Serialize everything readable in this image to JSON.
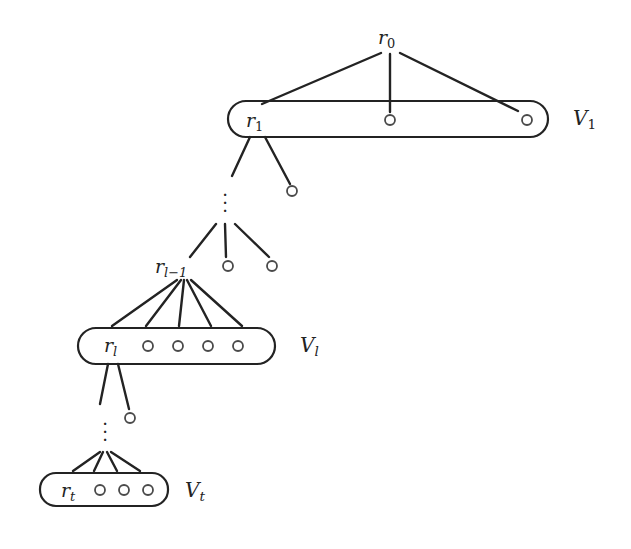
{
  "figure": {
    "type": "tree-diagram",
    "background_color": "#ffffff",
    "ink_color": "#232323"
  },
  "nodes": {
    "r0": {
      "label_base": "r",
      "label_sub": "0",
      "x": 390,
      "y": 38
    },
    "r1": {
      "label_base": "r",
      "label_sub": "1",
      "x": 258,
      "y": 121
    },
    "rl1": {
      "label_base": "r",
      "label_sub": "l−1",
      "x": 184,
      "y": 267
    },
    "rl": {
      "label_base": "r",
      "label_sub": "l",
      "x": 114,
      "y": 346
    },
    "rt": {
      "label_base": "r",
      "label_sub": "t",
      "x": 72,
      "y": 491
    }
  },
  "node_labels": {
    "r0": "r0",
    "r1": "r1",
    "rl1": "rl-1",
    "rl": "rl",
    "rt": "rt"
  },
  "set_labels": [
    {
      "name": "V1",
      "base": "V",
      "sub": "1",
      "x": 573,
      "y": 110
    },
    {
      "name": "Vl",
      "base": "V",
      "sub": "l",
      "x": 300,
      "y": 337
    },
    {
      "name": "Vt",
      "base": "V",
      "sub": "t",
      "x": 185,
      "y": 482
    }
  ],
  "capsules": [
    {
      "name": "V1-capsule",
      "x": 228,
      "y": 101,
      "width": 320,
      "height": 36,
      "radius": 18
    },
    {
      "name": "Vl-capsule",
      "x": 78,
      "y": 328,
      "width": 197,
      "height": 36,
      "radius": 18
    },
    {
      "name": "Vt-capsule",
      "x": 40,
      "y": 473,
      "width": 128,
      "height": 33,
      "radius": 16
    }
  ],
  "circles": [
    {
      "layer": "V1",
      "x": 390,
      "y": 120,
      "r": 5
    },
    {
      "layer": "V1",
      "x": 527,
      "y": 120,
      "r": 5
    },
    {
      "layer": "between-V1-Vl1",
      "x": 292,
      "y": 191,
      "r": 5
    },
    {
      "layer": "Vl-1-row",
      "x": 228,
      "y": 266,
      "r": 5
    },
    {
      "layer": "Vl-1-row",
      "x": 272,
      "y": 266,
      "r": 5
    },
    {
      "layer": "Vl",
      "x": 148,
      "y": 346,
      "r": 5
    },
    {
      "layer": "Vl",
      "x": 178,
      "y": 346,
      "r": 5
    },
    {
      "layer": "Vl",
      "x": 208,
      "y": 346,
      "r": 5
    },
    {
      "layer": "Vl",
      "x": 238,
      "y": 346,
      "r": 5
    },
    {
      "layer": "between-Vl-Vt",
      "x": 130,
      "y": 418,
      "r": 5
    },
    {
      "layer": "Vt",
      "x": 100,
      "y": 491,
      "r": 5
    },
    {
      "layer": "Vt",
      "x": 124,
      "y": 491,
      "r": 5
    },
    {
      "layer": "Vt",
      "x": 148,
      "y": 491,
      "r": 5
    }
  ],
  "vdots": [
    {
      "name": "vdots-upper",
      "x": 225,
      "y": 188
    },
    {
      "name": "vdots-lower",
      "x": 105,
      "y": 417
    }
  ],
  "edges": [
    {
      "from": "r0",
      "to": "V1-left",
      "x1": 381,
      "y1": 53,
      "x2": 262,
      "y2": 104
    },
    {
      "from": "r0",
      "to": "V1-mid",
      "x1": 390,
      "y1": 54,
      "x2": 390,
      "y2": 112
    },
    {
      "from": "r0",
      "to": "V1-right",
      "x1": 400,
      "y1": 53,
      "x2": 518,
      "y2": 111
    },
    {
      "from": "r1",
      "to": "vdots-up",
      "x1": 250,
      "y1": 138,
      "x2": 232,
      "y2": 176
    },
    {
      "from": "r1",
      "to": "circle-292",
      "x1": 265,
      "y1": 138,
      "x2": 290,
      "y2": 184
    },
    {
      "from": "vdots",
      "to": "rl1",
      "x1": 216,
      "y1": 224,
      "x2": 190,
      "y2": 258
    },
    {
      "from": "vdots",
      "to": "rl1-mid",
      "x1": 225,
      "y1": 224,
      "x2": 225,
      "y2": 258
    },
    {
      "from": "vdots",
      "to": "rl1-r",
      "x1": 234,
      "y1": 224,
      "x2": 269,
      "y2": 258
    },
    {
      "from": "rl1",
      "to": "Vl-1",
      "x1": 178,
      "y1": 280,
      "x2": 112,
      "y2": 326
    },
    {
      "from": "rl1",
      "to": "Vl-2",
      "x1": 181,
      "y1": 280,
      "x2": 146,
      "y2": 326
    },
    {
      "from": "rl1",
      "to": "Vl-3",
      "x1": 184,
      "y1": 280,
      "x2": 178,
      "y2": 326
    },
    {
      "from": "rl1",
      "to": "Vl-4",
      "x1": 187,
      "y1": 280,
      "x2": 210,
      "y2": 326
    },
    {
      "from": "rl1",
      "to": "Vl-5",
      "x1": 190,
      "y1": 280,
      "x2": 241,
      "y2": 326
    },
    {
      "from": "rl",
      "to": "vdots-low",
      "x1": 108,
      "y1": 364,
      "x2": 100,
      "y2": 404
    },
    {
      "from": "rl",
      "to": "circle-130",
      "x1": 118,
      "y1": 364,
      "x2": 129,
      "y2": 408
    },
    {
      "from": "vdots2",
      "to": "Vt-1",
      "x1": 100,
      "y1": 452,
      "x2": 73,
      "y2": 472
    },
    {
      "from": "vdots2",
      "to": "Vt-2",
      "x1": 103,
      "y1": 452,
      "x2": 93,
      "y2": 472
    },
    {
      "from": "vdots2",
      "to": "Vt-3",
      "x1": 107,
      "y1": 452,
      "x2": 116,
      "y2": 472
    },
    {
      "from": "vdots2",
      "to": "Vt-4",
      "x1": 110,
      "y1": 452,
      "x2": 139,
      "y2": 472
    }
  ]
}
